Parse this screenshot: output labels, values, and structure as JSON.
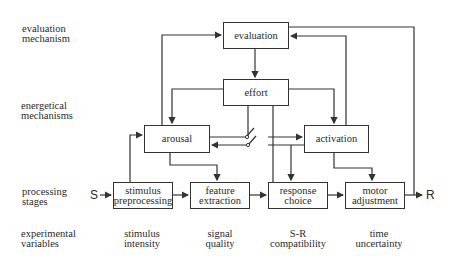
{
  "row_labels": {
    "evaluation": [
      "evaluation",
      "mechanism"
    ],
    "energetical": [
      "energetical",
      "mechanisms"
    ],
    "processing": [
      "processing",
      "stages"
    ],
    "experimental": [
      "experimental",
      "variables"
    ]
  },
  "boxes": {
    "evaluation": "evaluation",
    "effort": "effort",
    "arousal": "arousal",
    "activation": "activation",
    "stimulus_preprocessing": [
      "stimulus",
      "preprocessing"
    ],
    "feature_extraction": [
      "feature",
      "extraction"
    ],
    "response_choice": [
      "response",
      "choice"
    ],
    "motor_adjustment": [
      "motor",
      "adjustment"
    ]
  },
  "io": {
    "input": "S",
    "output": "R"
  },
  "variables": {
    "stimulus_intensity": [
      "stimulus",
      "intensity"
    ],
    "signal_quality": [
      "signal",
      "quality"
    ],
    "sr_compatibility": [
      "S-R",
      "compatibility"
    ],
    "time_uncertainty": [
      "time",
      "uncertainty"
    ]
  },
  "colors": {
    "line": "#333333",
    "text": "#2a2a2a",
    "background": "#ffffff"
  }
}
